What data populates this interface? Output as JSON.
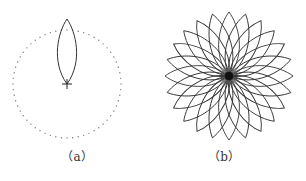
{
  "figure": {
    "panels": [
      {
        "id": "a",
        "caption": "（a）",
        "caption_pos": [
          77,
          147
        ],
        "circle": {
          "cx": 67,
          "cy": 84,
          "r": 54,
          "dots": 60,
          "color": "#777777"
        },
        "petal": {
          "cx": 67,
          "cy": 84,
          "length": 65,
          "half_width": 12,
          "color": "#333333"
        },
        "cross": {
          "cx": 67,
          "cy": 84,
          "size": 5
        }
      },
      {
        "id": "b",
        "caption": "（b）",
        "caption_pos": [
          224,
          147
        ],
        "flower": {
          "cx": 229,
          "cy": 76,
          "petals": 24,
          "length": 64,
          "half_width": 13,
          "color": "#333333",
          "center_radius": 4
        }
      }
    ]
  }
}
